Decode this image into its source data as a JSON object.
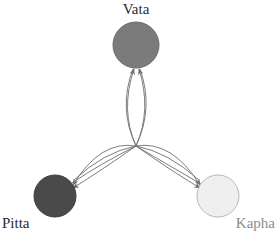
{
  "diagram": {
    "background_color": "#ffffff",
    "edge_color": "#6e6e6e",
    "edge_width": 0.9,
    "center_point": {
      "x": 136,
      "y": 146
    },
    "nodes": [
      {
        "id": "vata",
        "label": "Vata",
        "cx": 136,
        "cy": 45,
        "r": 23,
        "fill": "#7b7b7b",
        "stroke": "#6a6a6a",
        "label_x": 136,
        "label_y": 14,
        "label_anchor": "middle",
        "label_color": "#2b2b2b"
      },
      {
        "id": "pitta",
        "label": "Pitta",
        "cx": 55,
        "cy": 196,
        "r": 21,
        "fill": "#4a4a4a",
        "stroke": "#3f3f3f",
        "label_x": 2,
        "label_y": 228,
        "label_anchor": "start",
        "label_color": "#2b2b2b"
      },
      {
        "id": "kapha",
        "label": "Kapha",
        "cx": 218,
        "cy": 196,
        "r": 21,
        "fill": "#efefef",
        "stroke": "#b8b8b8",
        "label_x": 275,
        "label_y": 228,
        "label_anchor": "end",
        "label_color": "#8c8c8c"
      }
    ],
    "edges": [
      {
        "id": "vata-to-pitta",
        "from": "vata",
        "to": "pitta",
        "arrowhead": "to-pitta"
      },
      {
        "id": "pitta-to-vata",
        "from": "pitta",
        "to": "vata",
        "arrowhead": "to-vata"
      },
      {
        "id": "vata-to-kapha",
        "from": "vata",
        "to": "kapha",
        "arrowhead": "to-kapha"
      },
      {
        "id": "kapha-to-vata",
        "from": "kapha",
        "to": "vata",
        "arrowhead": "to-vata"
      },
      {
        "id": "pitta-to-kapha",
        "from": "pitta",
        "to": "kapha",
        "arrowhead": "to-kapha"
      },
      {
        "id": "kapha-to-pitta",
        "from": "kapha",
        "to": "pitta",
        "arrowhead": "to-pitta"
      }
    ]
  }
}
